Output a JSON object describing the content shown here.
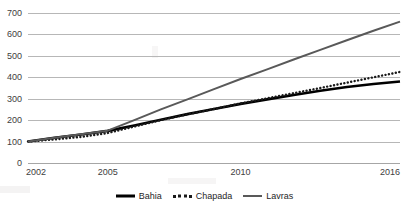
{
  "chart_data": {
    "type": "line",
    "title": "",
    "xlabel": "",
    "ylabel": "",
    "x": [
      2002,
      2003,
      2004,
      2005,
      2006,
      2007,
      2008,
      2009,
      2010,
      2011,
      2012,
      2013,
      2014,
      2015,
      2016
    ],
    "xlim": [
      2002,
      2016
    ],
    "ylim": [
      0,
      700
    ],
    "ytick_labels": [
      "700",
      "600",
      "500",
      "400",
      "300",
      "200",
      "100",
      "0"
    ],
    "ytick_values": [
      700,
      600,
      500,
      400,
      300,
      200,
      100,
      0
    ],
    "xtick_labels": [
      "2002",
      "2005",
      "2010",
      "2016"
    ],
    "xtick_values": [
      2002,
      2005,
      2010,
      2016
    ],
    "grid": "horizontal",
    "legend_position": "bottom",
    "series": [
      {
        "name": "Bahia",
        "style": "solid",
        "color": "#000000",
        "width": 2.6,
        "values": [
          100,
          118,
          133,
          150,
          175,
          202,
          228,
          252,
          276,
          297,
          317,
          337,
          355,
          369,
          380
        ]
      },
      {
        "name": "Chapada",
        "style": "dotted",
        "color": "#1a1a1a",
        "width": 2.4,
        "values": [
          100,
          110,
          122,
          140,
          170,
          200,
          227,
          252,
          278,
          302,
          326,
          350,
          375,
          400,
          425
        ]
      },
      {
        "name": "Lavras",
        "style": "solid",
        "color": "#595959",
        "width": 2.0,
        "values": [
          100,
          118,
          134,
          151,
          200,
          250,
          297,
          345,
          392,
          437,
          483,
          528,
          573,
          617,
          660
        ]
      }
    ]
  },
  "legend": {
    "items": [
      {
        "label": "Bahia",
        "marker": "solid-thick",
        "color": "#000000"
      },
      {
        "label": "Chapada",
        "marker": "dotted",
        "color": "#1a1a1a"
      },
      {
        "label": "Lavras",
        "marker": "solid-medium",
        "color": "#595959"
      }
    ]
  }
}
